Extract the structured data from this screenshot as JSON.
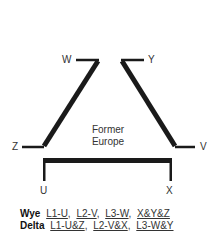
{
  "diagram": {
    "terminals": {
      "W": "W",
      "Y": "Y",
      "Z": "Z",
      "V": "V",
      "U": "U",
      "X": "X"
    },
    "center_label": {
      "line1": "Former",
      "line2": "Europe"
    },
    "stroke_color": "#1a1a1a"
  },
  "legend": {
    "wye": {
      "key": "Wye",
      "terms": [
        "L1-U",
        "L2-V",
        "L3-W",
        "X&Y&Z"
      ]
    },
    "delta": {
      "key": "Delta",
      "terms": [
        "L1-U&Z",
        "L2-V&X",
        "L3-W&Y"
      ]
    }
  }
}
